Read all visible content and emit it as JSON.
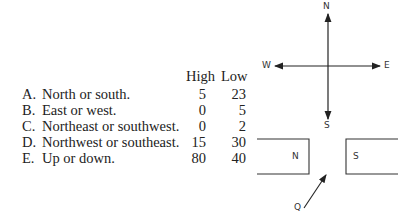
{
  "table": {
    "headers": {
      "high": "High",
      "low": "Low"
    },
    "rows": [
      {
        "letter": "A.",
        "label": "North or south.",
        "high": "5",
        "low": "23"
      },
      {
        "letter": "B.",
        "label": "East or west.",
        "high": "0",
        "low": "5"
      },
      {
        "letter": "C.",
        "label": "Northeast or southwest.",
        "high": "0",
        "low": "2"
      },
      {
        "letter": "D.",
        "label": "Northwest or southeast.",
        "high": "15",
        "low": "30"
      },
      {
        "letter": "E.",
        "label": "Up or down.",
        "high": "80",
        "low": "40"
      }
    ]
  },
  "compass": {
    "north": "N",
    "south": "S",
    "east": "E",
    "west": "W"
  },
  "magnets": {
    "left_label": "N",
    "right_label": "S",
    "particle_label": "Q"
  }
}
